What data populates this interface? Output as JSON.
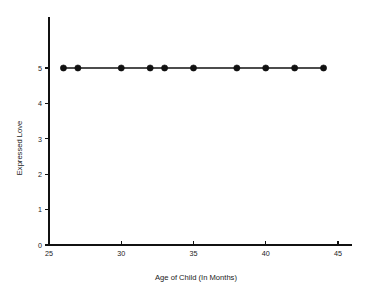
{
  "chart_data": {
    "type": "line",
    "title": "",
    "xlabel": "Age of Child (In Months)",
    "ylabel": "Expressed Love",
    "x": [
      26,
      27,
      30,
      32,
      33,
      35,
      38,
      40,
      42,
      44
    ],
    "values": [
      5,
      5,
      5,
      5,
      5,
      5,
      5,
      5,
      5,
      5
    ],
    "series": [
      {
        "name": "Expressed Love",
        "x": [
          26,
          27,
          30,
          32,
          33,
          35,
          38,
          40,
          42,
          44
        ],
        "values": [
          5,
          5,
          5,
          5,
          5,
          5,
          5,
          5,
          5,
          5
        ]
      }
    ],
    "xlim": [
      25,
      46
    ],
    "ylim": [
      0,
      5.8
    ],
    "xticks": [
      25,
      30,
      35,
      40,
      45
    ],
    "xtick_labels": [
      "25",
      "30",
      "35",
      "40",
      "45"
    ],
    "yticks": [
      0,
      1,
      2,
      3,
      4,
      5
    ],
    "ytick_labels": [
      "0",
      "1",
      "2",
      "3",
      "4",
      "5"
    ],
    "grid": false,
    "legend": false,
    "legend_position": "none",
    "marker": "filled-circle",
    "line_color": "#111111",
    "marker_color": "#111111",
    "background_color": "#ffffff",
    "annotations": []
  }
}
